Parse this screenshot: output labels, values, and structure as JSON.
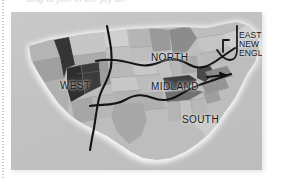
{
  "figure": {
    "kind": "map-image",
    "caption_sliver": "sing to join in the joy an",
    "panel_background": "#c4c4c4",
    "boundary_line_color": "#111111",
    "coastline_glow_color": "#f2f2f2",
    "page_background": "#ffffff",
    "margin_rule_color": "#b9b9b9"
  },
  "map": {
    "region_labels": [
      {
        "id": "west",
        "text": "WEST",
        "x": 49,
        "y": 69
      },
      {
        "id": "north",
        "text": "NORTH",
        "x": 140,
        "y": 41
      },
      {
        "id": "midland",
        "text": "MIDLAND",
        "x": 140,
        "y": 70
      },
      {
        "id": "south",
        "text": "SOUTH",
        "x": 171,
        "y": 103
      }
    ],
    "callout": {
      "id": "eastern-new-england",
      "line1": "EASTERN",
      "line2": "NEW",
      "line3": "ENGLAND",
      "x": 228,
      "y": 19,
      "has_leader_bracket": true,
      "has_arrow_marker": true
    },
    "shading": {
      "scale": "grayscale choropleth",
      "lightest": "#dcdcdc",
      "light": "#cfcfcf",
      "mid_light": "#c0c0c0",
      "mid": "#a9a9a9",
      "mid_dark": "#8f8f8f",
      "dark": "#6e6e6e",
      "darkest": "#333333"
    },
    "dark_states_note": "Idaho, Nevada, Utah/Colorado corridor and Appalachian belt rendered near-black"
  }
}
